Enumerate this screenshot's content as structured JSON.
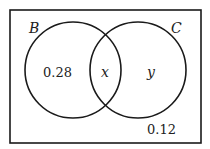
{
  "diagram": {
    "type": "venn",
    "sets": [
      {
        "name": "B",
        "label": "B"
      },
      {
        "name": "C",
        "label": "C"
      }
    ],
    "regions": {
      "b_only": "0.28",
      "intersection": "x",
      "c_only": "y",
      "outside": "0.12"
    },
    "colors": {
      "stroke": "#1a1a1a",
      "background": "#ffffff"
    }
  }
}
